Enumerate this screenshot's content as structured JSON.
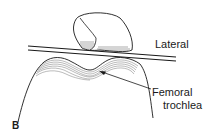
{
  "figure": {
    "panel_label": "B",
    "labels": {
      "lateral": "Lateral",
      "femoral_line1": "Femoral",
      "femoral_line2": "trochlea"
    },
    "structures": [
      "patella",
      "reference-lines",
      "femoral-condyles",
      "arrow"
    ],
    "colors": {
      "line": "#1a1a1a",
      "hatch": "#555555",
      "background": "#ffffff"
    }
  }
}
